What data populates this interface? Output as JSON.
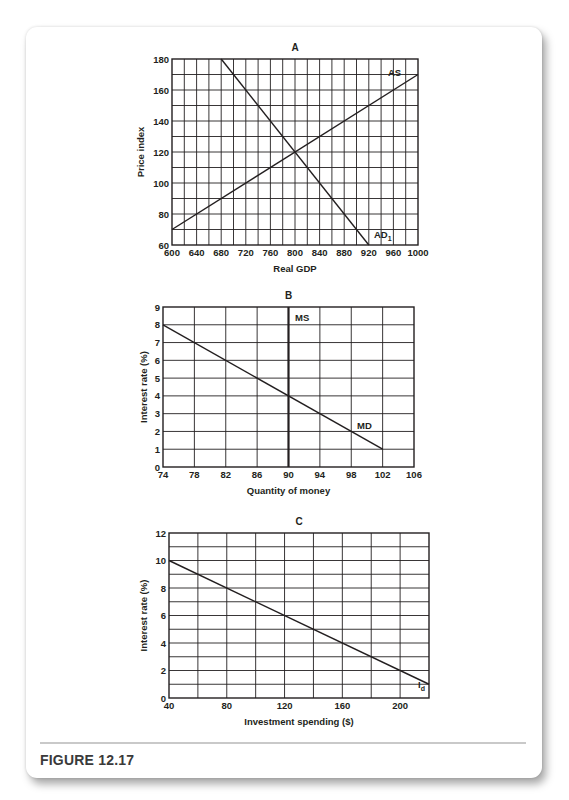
{
  "figure": {
    "label": "FIGURE 12.17"
  },
  "chart_data": [
    {
      "panel": "A",
      "type": "line",
      "title": "A",
      "xlabel": "Real GDP",
      "ylabel": "Price index",
      "xlim": [
        600,
        1000
      ],
      "ylim": [
        60,
        180
      ],
      "xticks": [
        600,
        640,
        680,
        720,
        760,
        800,
        840,
        880,
        920,
        960,
        1000
      ],
      "yticks": [
        60,
        80,
        100,
        120,
        140,
        160,
        180
      ],
      "xgrid_step": 20,
      "ygrid_step": 10,
      "grid": true,
      "box": {
        "left": 172,
        "top": 59,
        "right": 418,
        "bottom": 245
      },
      "series": [
        {
          "name": "AS",
          "x": [
            600,
            1000
          ],
          "y": [
            70,
            170
          ],
          "label_at": [
            388,
            76
          ]
        },
        {
          "name": "AD1",
          "label_main": "AD",
          "label_sub": "1",
          "x": [
            680,
            920
          ],
          "y": [
            180,
            60
          ],
          "label_at": [
            374,
            238
          ]
        }
      ],
      "equilibrium": {
        "x": 800,
        "y": 120
      }
    },
    {
      "panel": "B",
      "type": "line",
      "title": "B",
      "xlabel": "Quantity of money",
      "ylabel": "Interest rate (%)",
      "xlim": [
        74,
        106
      ],
      "ylim": [
        0,
        9
      ],
      "xticks": [
        74,
        78,
        82,
        86,
        90,
        94,
        98,
        102,
        106
      ],
      "yticks": [
        0,
        1,
        2,
        3,
        4,
        5,
        6,
        7,
        8,
        9
      ],
      "xgrid_step": 4,
      "ygrid_step": 1,
      "grid": true,
      "box": {
        "left": 163,
        "top": 307,
        "right": 414,
        "bottom": 467
      },
      "series": [
        {
          "name": "MS",
          "x": [
            90,
            90
          ],
          "y": [
            0,
            9
          ],
          "label_at": [
            295,
            321
          ],
          "thick": true
        },
        {
          "name": "MD",
          "x": [
            74,
            102
          ],
          "y": [
            8,
            1
          ],
          "label_at": [
            357,
            429
          ]
        }
      ],
      "equilibrium": {
        "x": 90,
        "y": 4
      }
    },
    {
      "panel": "C",
      "type": "line",
      "title": "C",
      "xlabel": "Investment spending ($)",
      "ylabel": "Interest rate (%)",
      "xlim": [
        40,
        220
      ],
      "ylim": [
        0,
        12
      ],
      "xticks": [
        40,
        80,
        120,
        160,
        200
      ],
      "yticks": [
        0,
        2,
        4,
        6,
        8,
        10,
        12
      ],
      "xgrid_step": 20,
      "ygrid_step": 1,
      "grid": true,
      "box": {
        "left": 169,
        "top": 533,
        "right": 429,
        "bottom": 698
      },
      "series": [
        {
          "name": "Id",
          "label_main": "I",
          "label_sub": "d",
          "x": [
            40,
            220
          ],
          "y": [
            10,
            1
          ],
          "label_at": [
            418,
            688
          ]
        }
      ]
    }
  ]
}
